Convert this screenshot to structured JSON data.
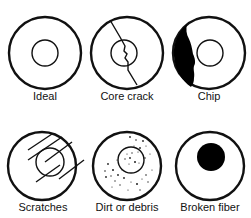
{
  "panels": [
    {
      "id": "ideal",
      "label": "Ideal",
      "icon": "ideal-fiber-icon"
    },
    {
      "id": "core-crack",
      "label": "Core crack",
      "icon": "core-crack-icon"
    },
    {
      "id": "chip",
      "label": "Chip",
      "icon": "chip-icon"
    },
    {
      "id": "scratches",
      "label": "Scratches",
      "icon": "scratches-icon"
    },
    {
      "id": "dirt",
      "label": "Dirt or debris",
      "icon": "dirt-debris-icon"
    },
    {
      "id": "broken",
      "label": "Broken fiber",
      "icon": "broken-fiber-icon"
    }
  ],
  "colors": {
    "stroke": "#111111",
    "fill": "#000000",
    "background": "#ffffff"
  }
}
